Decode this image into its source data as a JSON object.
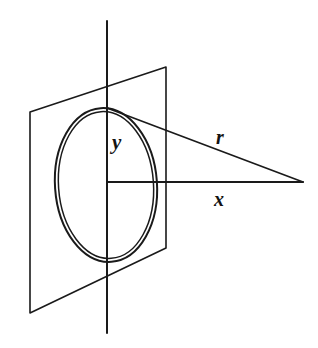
{
  "figure": {
    "kind": "geometry-diagram",
    "background_color": "#ffffff",
    "ink_color": "#1a1a1a",
    "canvas": {
      "width": 318,
      "height": 348
    },
    "labels": [
      {
        "id": "y",
        "text": "y",
        "x": 112,
        "y": 132,
        "font_size": 21,
        "style": "italic-serif"
      },
      {
        "id": "x",
        "text": "x",
        "x": 214,
        "y": 189,
        "font_size": 20,
        "style": "italic-serif"
      },
      {
        "id": "r",
        "text": "r",
        "x": 216,
        "y": 127,
        "font_size": 20,
        "style": "italic-serif"
      }
    ],
    "plane": {
      "name": "perspective-plane-parallelogram",
      "corners": [
        {
          "x": 30,
          "y": 112
        },
        {
          "x": 166,
          "y": 67
        },
        {
          "x": 166,
          "y": 248
        },
        {
          "x": 30,
          "y": 313
        }
      ]
    },
    "loop": {
      "name": "current-loop-ellipse",
      "center": {
        "x": 106,
        "y": 185
      },
      "rx": 51,
      "ry": 77,
      "rotation_deg": -4,
      "double_line_offset": 3
    },
    "axes": {
      "vertical": {
        "x": 107,
        "y1": 21,
        "y2": 333
      },
      "horizontal": {
        "y": 182,
        "x1": 107,
        "x2": 303
      }
    },
    "ray": {
      "name": "r-hypotenuse",
      "from": {
        "x": 107,
        "y": 108
      },
      "to": {
        "x": 303,
        "y": 182
      }
    }
  }
}
